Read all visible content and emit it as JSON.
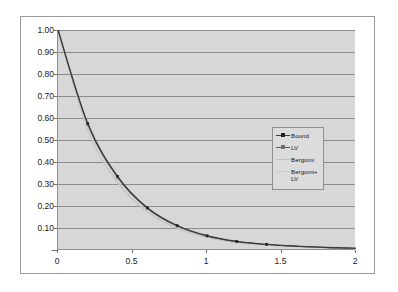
{
  "chart_data": {
    "type": "line",
    "title": "",
    "xlabel": "",
    "ylabel": "",
    "xlim": [
      0,
      2
    ],
    "ylim": [
      0,
      1.0
    ],
    "grid": true,
    "legend_position": "inside-right",
    "x_ticks": [
      "0",
      "0.5",
      "1",
      "1.5",
      "2"
    ],
    "x_tick_values": [
      0,
      0.5,
      1,
      1.5,
      2
    ],
    "y_ticks": [
      "1.00",
      "0.90",
      "0.80",
      "0.70",
      "0.60",
      "0.50",
      "0.40",
      "0.30",
      "0.20",
      "0.10",
      "-"
    ],
    "y_tick_values": [
      1.0,
      0.9,
      0.8,
      0.7,
      0.6,
      0.5,
      0.4,
      0.3,
      0.2,
      0.1,
      0.0
    ],
    "x": [
      0,
      0.2,
      0.4,
      0.6,
      0.8,
      1.0,
      1.2,
      1.4,
      1.6,
      1.8,
      2.0
    ],
    "series": [
      {
        "name": "Bound",
        "color": "#3a3a3a",
        "marker": "square",
        "values": [
          1.0,
          0.575,
          0.335,
          0.192,
          0.111,
          0.065,
          0.039,
          0.026,
          0.018,
          0.012,
          0.008
        ]
      },
      {
        "name": "LV",
        "color": "#5a5a5a",
        "marker": "square",
        "values": [
          1.0,
          0.57,
          0.33,
          0.189,
          0.109,
          0.063,
          0.038,
          0.025,
          0.017,
          0.011,
          0.008
        ]
      },
      {
        "name": "Bergomi",
        "color": "#c0c0c0",
        "marker": "none",
        "values": [
          1.0,
          0.545,
          0.305,
          0.172,
          0.098,
          0.057,
          0.034,
          0.022,
          0.015,
          0.01,
          0.007
        ]
      },
      {
        "name": "Bergomi+LV",
        "color": "#cccccc",
        "marker": "none",
        "values": [
          1.0,
          0.55,
          0.312,
          0.178,
          0.102,
          0.059,
          0.036,
          0.023,
          0.016,
          0.011,
          0.007
        ]
      }
    ]
  },
  "legend": {
    "entries": [
      {
        "label": "Bound"
      },
      {
        "label": "LV"
      },
      {
        "label": "Bergomi"
      },
      {
        "label": "Bergomi+LV"
      }
    ]
  }
}
